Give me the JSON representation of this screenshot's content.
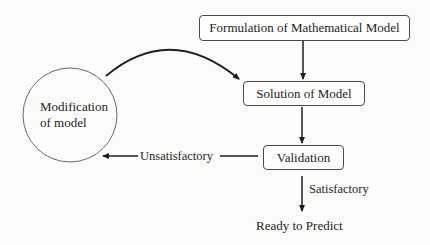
{
  "diagram": {
    "type": "flowchart",
    "nodes": {
      "formulation": {
        "label": "Formulation of Mathematical Model",
        "shape": "rounded-rect"
      },
      "solution": {
        "label": "Solution of Model",
        "shape": "rounded-rect"
      },
      "validation": {
        "label": "Validation",
        "shape": "rounded-rect"
      },
      "modification": {
        "line1": "Modification",
        "line2": "of model",
        "shape": "circle"
      },
      "ready": {
        "label": "Ready to Predict",
        "shape": "text"
      }
    },
    "edges": [
      {
        "from": "formulation",
        "to": "solution",
        "label": ""
      },
      {
        "from": "solution",
        "to": "validation",
        "label": ""
      },
      {
        "from": "validation",
        "to": "modification",
        "label": "Unsatisfactory"
      },
      {
        "from": "validation",
        "to": "ready",
        "label": "Satisfactory"
      },
      {
        "from": "modification",
        "to": "solution",
        "label": ""
      }
    ],
    "edge_labels": {
      "unsatisfactory": "Unsatisfactory",
      "satisfactory": "Satisfactory"
    },
    "colors": {
      "stroke": "#1e1e1e",
      "background": "#fbfbfa"
    }
  }
}
